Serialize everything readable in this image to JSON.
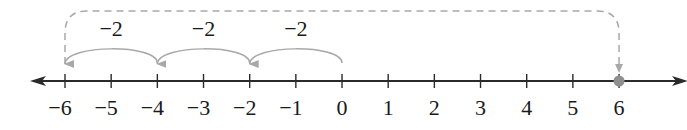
{
  "number_line": {
    "min": -6,
    "max": 6,
    "ticks": [
      {
        "value": -6,
        "label": "−6"
      },
      {
        "value": -5,
        "label": "−5"
      },
      {
        "value": -4,
        "label": "−4"
      },
      {
        "value": -3,
        "label": "−3"
      },
      {
        "value": -2,
        "label": "−2"
      },
      {
        "value": -1,
        "label": "−1"
      },
      {
        "value": 0,
        "label": "0"
      },
      {
        "value": 1,
        "label": "1"
      },
      {
        "value": 2,
        "label": "2"
      },
      {
        "value": 3,
        "label": "3"
      },
      {
        "value": 4,
        "label": "4"
      },
      {
        "value": 5,
        "label": "5"
      },
      {
        "value": 6,
        "label": "6"
      }
    ],
    "arrows_both_ends": true
  },
  "jumps": [
    {
      "from": 0,
      "to": -2,
      "label": "−2"
    },
    {
      "from": -2,
      "to": -4,
      "label": "−2"
    },
    {
      "from": -4,
      "to": -6,
      "label": "−2"
    }
  ],
  "reflection": {
    "from": -6,
    "to": 6,
    "style": "dashed",
    "point": 6
  },
  "colors": {
    "axis": "#2a2a2a",
    "arc": "#a8a8a8",
    "dashed": "#a8a8a8",
    "point": "#8f8f8f"
  }
}
